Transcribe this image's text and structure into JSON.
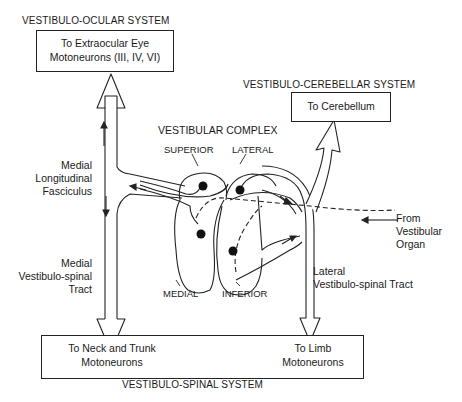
{
  "systems": {
    "ocular": "VESTIBULO-OCULAR  SYSTEM",
    "cerebellar": "VESTIBULO-CEREBELLAR  SYSTEM",
    "spinal": "VESTIBULO-SPINAL  SYSTEM"
  },
  "boxes": {
    "eye_line1": "To Extraocular Eye",
    "eye_line2": "Motoneurons (III, IV, VI)",
    "cerebellum": "To Cerebellum",
    "neck_line1": "To Neck and Trunk",
    "neck_line2": "Motoneurons",
    "limb_line1": "To Limb",
    "limb_line2": "Motoneurons"
  },
  "complex": {
    "title": "VESTIBULAR  COMPLEX",
    "superior": "SUPERIOR",
    "lateral": "LATERAL",
    "medial": "MEDIAL",
    "inferior": "INFERIOR"
  },
  "tracts": {
    "mlf_1": "Medial",
    "mlf_2": "Longitudinal",
    "mlf_3": "Fasciculus",
    "mvst_1": "Medial",
    "mvst_2": "Vestibulo-spinal",
    "mvst_3": "Tract",
    "lvst_1": "Lateral",
    "lvst_2": "Vestibulo-spinal Tract"
  },
  "input": {
    "line1": "From",
    "line2": "Vestibular",
    "line3": "Organ"
  }
}
